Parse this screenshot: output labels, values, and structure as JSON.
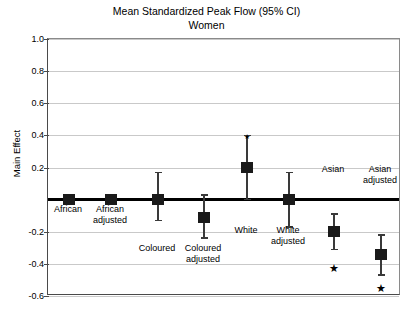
{
  "chart_data": {
    "type": "scatter",
    "title": "Mean Standardized Peak Flow (95% CI)",
    "subtitle": "Women",
    "xlabel": "",
    "ylabel": "Main Effect",
    "ylim": [
      -0.6,
      1.0
    ],
    "ytick_labels": [
      "1.0",
      "0.8",
      "0.6",
      "0.4",
      "0.2",
      "-0.2",
      "-0.4",
      "-0.6"
    ],
    "ytick_values": [
      1.0,
      0.8,
      0.6,
      0.4,
      0.2,
      -0.2,
      -0.4,
      -0.6
    ],
    "grid": true,
    "legend": "none",
    "reference_line": 0.0,
    "categories": [
      "African",
      "African adjusted",
      "Coloured",
      "Coloured adjusted",
      "White",
      "White adjusted",
      "Asian",
      "Asian adjusted"
    ],
    "points": [
      {
        "label": "African",
        "label_lines": [
          "African"
        ],
        "value": 0.0,
        "ci_low": 0.0,
        "ci_high": 0.0,
        "significant": false
      },
      {
        "label": "African adjusted",
        "label_lines": [
          "African",
          "adjusted"
        ],
        "value": 0.0,
        "ci_low": 0.0,
        "ci_high": 0.0,
        "significant": false
      },
      {
        "label": "Coloured",
        "label_lines": [
          "Coloured"
        ],
        "value": 0.0,
        "ci_low": -0.13,
        "ci_high": 0.17,
        "significant": false
      },
      {
        "label": "Coloured adjusted",
        "label_lines": [
          "Coloured",
          "adjusted"
        ],
        "value": -0.11,
        "ci_low": -0.24,
        "ci_high": 0.03,
        "significant": false
      },
      {
        "label": "White",
        "label_lines": [
          "White"
        ],
        "value": 0.2,
        "ci_low": 0.0,
        "ci_high": 0.4,
        "significant": true
      },
      {
        "label": "White adjusted",
        "label_lines": [
          "White",
          "adjusted"
        ],
        "value": 0.0,
        "ci_low": -0.17,
        "ci_high": 0.17,
        "significant": false
      },
      {
        "label": "Asian",
        "label_lines": [
          "Asian"
        ],
        "value": -0.2,
        "ci_low": -0.31,
        "ci_high": -0.09,
        "significant": true
      },
      {
        "label": "Asian adjusted",
        "label_lines": [
          "Asian",
          "adjusted"
        ],
        "value": -0.34,
        "ci_low": -0.47,
        "ci_high": -0.22,
        "significant": true
      }
    ],
    "significance_marker": "★"
  },
  "layout": {
    "marker_x": [
      68,
      110,
      157,
      203,
      246,
      288,
      333,
      380
    ],
    "label_top": [
      204,
      204,
      243,
      243,
      225,
      225,
      164,
      164
    ],
    "star_top": [
      null,
      null,
      null,
      null,
      131,
      null,
      263,
      283
    ]
  },
  "colors": {
    "marker": "#1a1a1a",
    "errorbar": "#3a3a3a",
    "grid": "#c9c9c9",
    "axis": "#4a4a4a",
    "reference_line": "#000000",
    "background": "#ffffff"
  }
}
